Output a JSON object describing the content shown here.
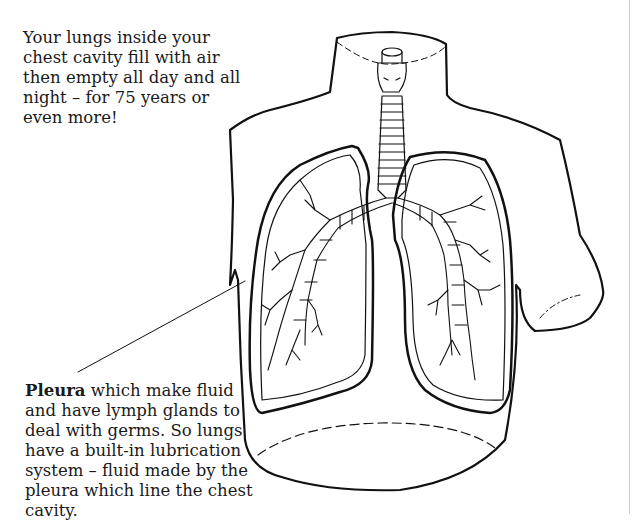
{
  "diagram": {
    "captions": {
      "top": "Your lungs inside your chest cavity fill with air then empty all day and all night – for 75 years or even more!",
      "pleura_term": "Pleura",
      "pleura_text": " which make fluid and have lymph glands to deal with germs. So lungs have a built-in lubrication system – fluid made by the pleura which line the chest cavity."
    },
    "labels": [
      {
        "term": "Pleura",
        "points_to": "pleural lining of left lung (viewer's left)"
      }
    ],
    "parts": [
      "torso outline",
      "trachea",
      "larynx",
      "bronchi",
      "bronchioles",
      "left lung",
      "right lung",
      "pleura",
      "diaphragm (dashed)"
    ]
  }
}
